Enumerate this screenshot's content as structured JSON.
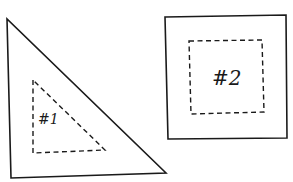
{
  "diagram": {
    "shapes": [
      {
        "id": "shape-1",
        "type": "right-triangle",
        "outer_points": "7,19 11,178 166,173",
        "inner_points": "33,80 33,153 105,150",
        "label": "#1",
        "label_x": 38,
        "label_y": 124,
        "label_size": 14
      },
      {
        "id": "shape-2",
        "type": "square",
        "outer_points": "165,17 286,15 287,138 168,139",
        "inner_points": "189,41 262,40 264,112 191,114",
        "label": "#2",
        "label_x": 212,
        "label_y": 85,
        "label_size": 20
      }
    ],
    "colors": {
      "stroke": "#1a1a1a",
      "background": "#ffffff"
    }
  }
}
